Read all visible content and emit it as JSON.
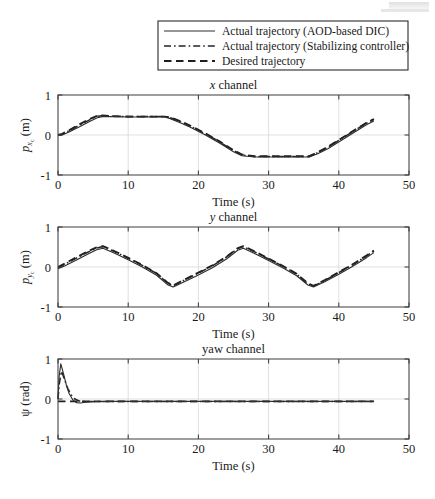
{
  "figure": {
    "legend": {
      "items": [
        {
          "label": "Actual trajectory (AOD-based DIC)",
          "style": "solid"
        },
        {
          "label": "Actual trajectory (Stabilizing controller)",
          "style": "dashdot"
        },
        {
          "label": "Desired trajectory",
          "style": "dashed"
        }
      ]
    },
    "shared": {
      "xlabel": "Time (s)",
      "xlim": [
        0,
        50
      ],
      "xticks": [
        0,
        10,
        20,
        30,
        40,
        50
      ],
      "xticklabels": [
        "0",
        "10",
        "20",
        "30",
        "40",
        "50"
      ],
      "ylim": [
        -1,
        1
      ],
      "yticks": [
        -1,
        0,
        1
      ],
      "yticklabels": [
        "-1",
        "0",
        "1"
      ],
      "grid": true,
      "colors": {
        "axis": "#3d3d3d",
        "grid": "#d2d2d2",
        "solid": "#2e2e2e",
        "dashdot": "#242424",
        "dashed": "#1f1f1f",
        "background": "#ffffff"
      }
    },
    "chart_data": [
      {
        "type": "line",
        "id": "x-channel",
        "title": "x channel",
        "title_italic_prefix": "x",
        "title_rest": " channel",
        "xlabel": "Time (s)",
        "ylabel": "p_{x_c} (m)",
        "ylabel_base": "p",
        "ylabel_sub": "x",
        "ylabel_sub2": "c",
        "ylabel_unit": " (m)",
        "xlim": [
          0,
          50
        ],
        "ylim": [
          -1,
          1
        ],
        "xticks": [
          0,
          10,
          20,
          30,
          40,
          50
        ],
        "yticks": [
          -1,
          0,
          1
        ],
        "grid": true,
        "series": [
          {
            "name": "Actual trajectory (AOD-based DIC)",
            "style": "solid",
            "x": [
              0,
              0.6,
              1.5,
              3,
              4.5,
              5.6,
              6.3,
              8,
              10,
              12,
              14,
              15.2,
              16,
              17.5,
              19,
              21,
              23,
              25,
              26.2,
              28,
              31,
              34,
              35.8,
              37,
              38.5,
              40.5,
              42.5,
              44,
              45
            ],
            "y": [
              -0.02,
              0.0,
              0.07,
              0.2,
              0.34,
              0.43,
              0.46,
              0.46,
              0.45,
              0.45,
              0.45,
              0.45,
              0.41,
              0.3,
              0.18,
              0.0,
              -0.2,
              -0.42,
              -0.52,
              -0.55,
              -0.55,
              -0.55,
              -0.55,
              -0.47,
              -0.34,
              -0.12,
              0.1,
              0.26,
              0.35
            ]
          },
          {
            "name": "Actual trajectory (Stabilizing controller)",
            "style": "dashdot",
            "x": [
              0,
              0.6,
              1.5,
              3,
              4.5,
              5.6,
              6.3,
              8,
              10,
              12,
              14,
              15.2,
              16,
              17.5,
              19,
              21,
              23,
              25,
              26.2,
              28,
              31,
              34,
              35.8,
              37,
              38.5,
              40.5,
              42.5,
              44,
              45
            ],
            "y": [
              -0.01,
              0.02,
              0.1,
              0.24,
              0.38,
              0.47,
              0.48,
              0.47,
              0.46,
              0.46,
              0.46,
              0.46,
              0.43,
              0.33,
              0.21,
              0.03,
              -0.17,
              -0.39,
              -0.5,
              -0.54,
              -0.54,
              -0.54,
              -0.54,
              -0.44,
              -0.3,
              -0.08,
              0.14,
              0.3,
              0.39
            ]
          },
          {
            "name": "Desired trajectory",
            "style": "dashed",
            "x": [
              0,
              0.6,
              1.5,
              3,
              4.5,
              5.6,
              6.3,
              8,
              10,
              12,
              14,
              15.2,
              16,
              17.5,
              19,
              21,
              23,
              25,
              26.2,
              28,
              31,
              34,
              35.8,
              37,
              38.5,
              40.5,
              42.5,
              44,
              45
            ],
            "y": [
              0.0,
              0.03,
              0.11,
              0.26,
              0.4,
              0.48,
              0.49,
              0.47,
              0.46,
              0.46,
              0.46,
              0.46,
              0.44,
              0.34,
              0.22,
              0.04,
              -0.16,
              -0.38,
              -0.49,
              -0.53,
              -0.53,
              -0.53,
              -0.53,
              -0.43,
              -0.29,
              -0.07,
              0.15,
              0.31,
              0.4
            ]
          }
        ]
      },
      {
        "type": "line",
        "id": "y-channel",
        "title": "y channel",
        "title_italic_prefix": "y",
        "title_rest": " channel",
        "xlabel": "Time (s)",
        "ylabel": "p_{y_c} (m)",
        "ylabel_base": "p",
        "ylabel_sub": "y",
        "ylabel_sub2": "c",
        "ylabel_unit": " (m)",
        "xlim": [
          0,
          50
        ],
        "ylim": [
          -1,
          1
        ],
        "xticks": [
          0,
          10,
          20,
          30,
          40,
          50
        ],
        "yticks": [
          -1,
          0,
          1
        ],
        "grid": true,
        "series": [
          {
            "name": "Actual trajectory (AOD-based DIC)",
            "style": "solid",
            "x": [
              0,
              1,
              2.5,
              4,
              5.5,
              6.4,
              8,
              10,
              12,
              14,
              15.6,
              16.4,
              18,
              20,
              22,
              24,
              25.6,
              26.4,
              28,
              30,
              32,
              34,
              35.6,
              36.4,
              38,
              40,
              42,
              44,
              45
            ],
            "y": [
              -0.04,
              0.03,
              0.16,
              0.3,
              0.43,
              0.47,
              0.35,
              0.18,
              0.0,
              -0.2,
              -0.44,
              -0.5,
              -0.37,
              -0.2,
              -0.02,
              0.2,
              0.42,
              0.47,
              0.34,
              0.16,
              -0.02,
              -0.22,
              -0.45,
              -0.5,
              -0.37,
              -0.18,
              0.02,
              0.24,
              0.36
            ]
          },
          {
            "name": "Actual trajectory (Stabilizing controller)",
            "style": "dashdot",
            "x": [
              0,
              1,
              2.5,
              4,
              5.5,
              6.4,
              8,
              10,
              12,
              14,
              15.6,
              16.4,
              18,
              20,
              22,
              24,
              25.6,
              26.4,
              28,
              30,
              32,
              34,
              35.6,
              36.4,
              38,
              40,
              42,
              44,
              45
            ],
            "y": [
              -0.02,
              0.07,
              0.21,
              0.35,
              0.47,
              0.51,
              0.39,
              0.22,
              0.04,
              -0.16,
              -0.4,
              -0.47,
              -0.33,
              -0.15,
              0.03,
              0.25,
              0.46,
              0.51,
              0.38,
              0.2,
              0.02,
              -0.18,
              -0.42,
              -0.48,
              -0.34,
              -0.14,
              0.06,
              0.28,
              0.4
            ]
          },
          {
            "name": "Desired trajectory",
            "style": "dashed",
            "x": [
              0,
              1,
              2.5,
              4,
              5.5,
              6.4,
              8,
              10,
              12,
              14,
              15.6,
              16.4,
              18,
              20,
              22,
              24,
              25.6,
              26.4,
              28,
              30,
              32,
              34,
              35.6,
              36.4,
              38,
              40,
              42,
              44,
              45
            ],
            "y": [
              0.0,
              0.09,
              0.23,
              0.37,
              0.49,
              0.52,
              0.4,
              0.23,
              0.05,
              -0.15,
              -0.39,
              -0.46,
              -0.32,
              -0.14,
              0.04,
              0.26,
              0.47,
              0.52,
              0.39,
              0.21,
              0.03,
              -0.17,
              -0.41,
              -0.47,
              -0.33,
              -0.13,
              0.07,
              0.29,
              0.41
            ]
          }
        ]
      },
      {
        "type": "line",
        "id": "yaw-channel",
        "title": "yaw channel",
        "title_italic_prefix": "",
        "title_rest": "yaw channel",
        "xlabel": "Time (s)",
        "ylabel": "psi (rad)",
        "ylabel_base": "ψ",
        "ylabel_sub": "",
        "ylabel_sub2": "",
        "ylabel_unit": " (rad)",
        "xlim": [
          0,
          50
        ],
        "ylim": [
          -1,
          1
        ],
        "xticks": [
          0,
          10,
          20,
          30,
          40,
          50
        ],
        "yticks": [
          -1,
          0,
          1
        ],
        "grid": true,
        "series": [
          {
            "name": "Actual trajectory (AOD-based DIC)",
            "style": "solid",
            "x": [
              0,
              0.15,
              0.4,
              0.8,
              1.2,
              1.6,
              2.1,
              2.6,
              3.2,
              4,
              5,
              7,
              10,
              15,
              20,
              25,
              30,
              35,
              40,
              45
            ],
            "y": [
              0.0,
              0.55,
              0.88,
              0.62,
              0.34,
              0.13,
              -0.02,
              -0.09,
              -0.1,
              -0.08,
              -0.07,
              -0.06,
              -0.06,
              -0.06,
              -0.06,
              -0.06,
              -0.06,
              -0.06,
              -0.06,
              -0.06
            ]
          },
          {
            "name": "Actual trajectory (Stabilizing controller)",
            "style": "dashdot",
            "x": [
              0,
              0.2,
              0.5,
              0.9,
              1.4,
              1.9,
              2.4,
              3,
              3.8,
              5,
              7,
              10,
              15,
              20,
              25,
              30,
              35,
              40,
              45
            ],
            "y": [
              0.0,
              0.4,
              0.7,
              0.5,
              0.26,
              0.1,
              0.0,
              -0.05,
              -0.06,
              -0.06,
              -0.06,
              -0.06,
              -0.06,
              -0.06,
              -0.06,
              -0.06,
              -0.06,
              -0.06,
              -0.06
            ]
          },
          {
            "name": "Desired trajectory",
            "style": "dashed",
            "x": [
              0,
              1,
              2,
              3,
              5,
              8,
              12,
              18,
              24,
              30,
              36,
              42,
              45
            ],
            "y": [
              -0.06,
              -0.06,
              -0.06,
              -0.06,
              -0.06,
              -0.06,
              -0.06,
              -0.06,
              -0.06,
              -0.06,
              -0.06,
              -0.06,
              -0.06
            ]
          }
        ]
      }
    ]
  }
}
